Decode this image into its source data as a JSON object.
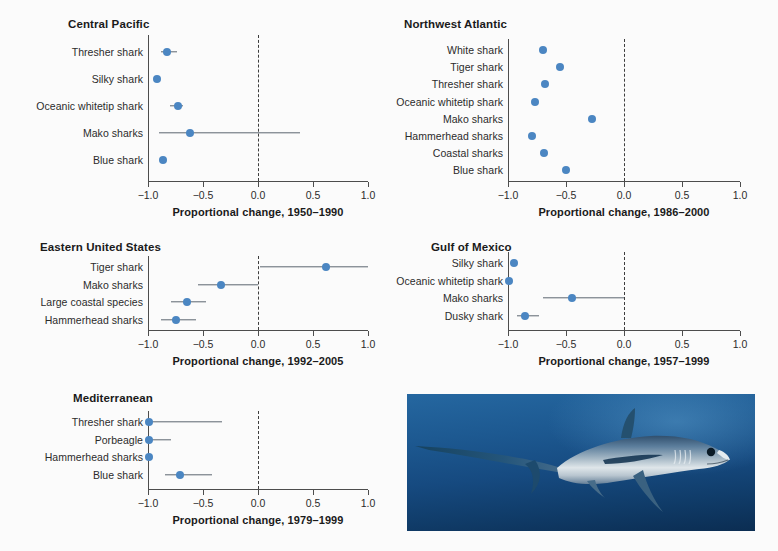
{
  "figure": {
    "background_color": "#fbfbfb",
    "dot_color": "#4b86c2",
    "bar_color": "#5c6670",
    "axis_color": "#4d4d4d"
  },
  "photo": {
    "alt_name": "thresher-shark-photograph",
    "subject": "Thresher shark",
    "water_color": "#15497d",
    "body_color": "#93a9bb"
  },
  "chart_data": [
    {
      "type": "scatter",
      "panel_id": "central-pacific",
      "title": "Central Pacific",
      "xlabel": "Proportional change, 1950–1990",
      "ylabel": "",
      "xlim": [
        -1.0,
        1.0
      ],
      "xticks": [
        -1.0,
        -0.5,
        0.0,
        0.5,
        1.0
      ],
      "xtick_labels": [
        "−1.0",
        "−0.5",
        "0.0",
        "0.5",
        "1.0"
      ],
      "grid": false,
      "zero_reference_line": 0.0,
      "categories": [
        "Thresher shark",
        "Silky shark",
        "Oceanic whitetip shark",
        "Mako sharks",
        "Blue shark"
      ],
      "values": [
        -0.83,
        -0.92,
        -0.73,
        -0.62,
        -0.86
      ],
      "error_low": [
        -0.88,
        -0.92,
        -0.8,
        -0.9,
        -0.86
      ],
      "error_high": [
        -0.74,
        -0.92,
        -0.68,
        0.38,
        -0.86
      ]
    },
    {
      "type": "scatter",
      "panel_id": "northwest-atlantic",
      "title": "Northwest Atlantic",
      "xlabel": "Proportional change, 1986–2000",
      "ylabel": "",
      "xlim": [
        -1.0,
        1.0
      ],
      "xticks": [
        -1.0,
        -0.5,
        0.0,
        0.5,
        1.0
      ],
      "xtick_labels": [
        "−1.0",
        "−0.5",
        "0.0",
        "0.5",
        "1.0"
      ],
      "grid": false,
      "zero_reference_line": 0.0,
      "categories": [
        "White shark",
        "Tiger shark",
        "Thresher shark",
        "Oceanic whitetip shark",
        "Mako sharks",
        "Hammerhead sharks",
        "Coastal sharks",
        "Blue shark"
      ],
      "values": [
        -0.7,
        -0.55,
        -0.68,
        -0.77,
        -0.28,
        -0.79,
        -0.69,
        -0.5
      ],
      "error_low": [
        -0.7,
        -0.55,
        -0.68,
        -0.77,
        -0.28,
        -0.79,
        -0.69,
        -0.5
      ],
      "error_high": [
        -0.7,
        -0.55,
        -0.68,
        -0.77,
        -0.28,
        -0.79,
        -0.69,
        -0.5
      ]
    },
    {
      "type": "scatter",
      "panel_id": "eastern-united-states",
      "title": "Eastern United States",
      "xlabel": "Proportional change, 1992–2005",
      "ylabel": "",
      "xlim": [
        -1.0,
        1.0
      ],
      "xticks": [
        -1.0,
        -0.5,
        0.0,
        0.5,
        1.0
      ],
      "xtick_labels": [
        "−1.0",
        "−0.5",
        "0.0",
        "0.5",
        "1.0"
      ],
      "grid": false,
      "zero_reference_line": 0.0,
      "categories": [
        "Tiger shark",
        "Mako sharks",
        "Large coastal species",
        "Hammerhead sharks"
      ],
      "values": [
        0.62,
        -0.34,
        -0.65,
        -0.75
      ],
      "error_low": [
        0.02,
        -0.55,
        -0.79,
        -0.88
      ],
      "error_high": [
        1.0,
        0.0,
        -0.47,
        -0.56
      ]
    },
    {
      "type": "scatter",
      "panel_id": "gulf-of-mexico",
      "title": "Gulf of Mexico",
      "xlabel": "Proportional change, 1957–1999",
      "ylabel": "",
      "xlim": [
        -1.0,
        1.0
      ],
      "xticks": [
        -1.0,
        -0.5,
        0.0,
        0.5,
        1.0
      ],
      "xtick_labels": [
        "−1.0",
        "−0.5",
        "0.0",
        "0.5",
        "1.0"
      ],
      "grid": false,
      "zero_reference_line": 0.0,
      "categories": [
        "Silky shark",
        "Oceanic whitetip shark",
        "Mako sharks",
        "Dusky shark"
      ],
      "values": [
        -0.95,
        -0.99,
        -0.45,
        -0.85
      ],
      "error_low": [
        -0.97,
        -0.99,
        -0.7,
        -0.92
      ],
      "error_high": [
        -0.93,
        -0.99,
        0.0,
        -0.73
      ]
    },
    {
      "type": "scatter",
      "panel_id": "mediterranean",
      "title": "Mediterranean",
      "xlabel": "Proportional change, 1979–1999",
      "ylabel": "",
      "xlim": [
        -1.0,
        1.0
      ],
      "xticks": [
        -1.0,
        -0.5,
        0.0,
        0.5,
        1.0
      ],
      "xtick_labels": [
        "−1.0",
        "−0.5",
        "0.0",
        "0.5",
        "1.0"
      ],
      "grid": false,
      "zero_reference_line": 0.0,
      "categories": [
        "Thresher shark",
        "Porbeagle",
        "Hammerhead sharks",
        "Blue shark"
      ],
      "values": [
        -0.99,
        -0.99,
        -0.99,
        -0.71
      ],
      "error_low": [
        -0.99,
        -0.99,
        -0.99,
        -0.85
      ],
      "error_high": [
        -0.33,
        -0.79,
        -0.99,
        -0.42
      ]
    }
  ]
}
